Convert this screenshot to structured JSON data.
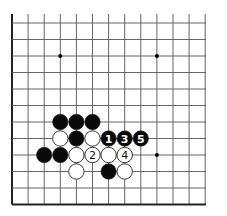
{
  "diagram": {
    "type": "go-board-fragment",
    "columns": 13,
    "rows": 12,
    "edges": [
      "left",
      "bottom"
    ],
    "origin": {
      "x": 12,
      "y": 23
    },
    "spacing": {
      "x": 16.1,
      "y": 16.5
    },
    "top_line_start": 14,
    "right_line_end": 206,
    "colors": {
      "line": "#555555",
      "edge": "#222222",
      "black": "#0a0a0a",
      "white": "#ffffff",
      "stone_outline": "#222222"
    },
    "star_points": [
      {
        "col": 3,
        "row": 2
      },
      {
        "col": 9,
        "row": 2
      },
      {
        "col": 9,
        "row": 8
      }
    ],
    "stones": [
      {
        "col": 3,
        "row": 6,
        "color": "black",
        "label": ""
      },
      {
        "col": 4,
        "row": 6,
        "color": "black",
        "label": ""
      },
      {
        "col": 5,
        "row": 6,
        "color": "black",
        "label": ""
      },
      {
        "col": 3,
        "row": 7,
        "color": "white",
        "label": ""
      },
      {
        "col": 4,
        "row": 7,
        "color": "black",
        "label": ""
      },
      {
        "col": 5,
        "row": 7,
        "color": "white",
        "label": ""
      },
      {
        "col": 6,
        "row": 7,
        "color": "black",
        "label": "1"
      },
      {
        "col": 7,
        "row": 7,
        "color": "black",
        "label": "3"
      },
      {
        "col": 8,
        "row": 7,
        "color": "black",
        "label": "5"
      },
      {
        "col": 2,
        "row": 8,
        "color": "black",
        "label": ""
      },
      {
        "col": 3,
        "row": 8,
        "color": "black",
        "label": ""
      },
      {
        "col": 4,
        "row": 8,
        "color": "white",
        "label": ""
      },
      {
        "col": 5,
        "row": 8,
        "color": "white",
        "label": "2"
      },
      {
        "col": 6,
        "row": 8,
        "color": "white",
        "label": ""
      },
      {
        "col": 7,
        "row": 8,
        "color": "white",
        "label": "4"
      },
      {
        "col": 4,
        "row": 9,
        "color": "white",
        "label": ""
      },
      {
        "col": 6,
        "row": 9,
        "color": "black",
        "label": ""
      },
      {
        "col": 7,
        "row": 9,
        "color": "white",
        "label": ""
      }
    ]
  }
}
